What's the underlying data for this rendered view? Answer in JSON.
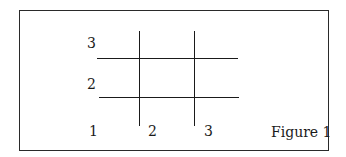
{
  "figure": {
    "caption": "Figure 1",
    "x_labels": [
      "1",
      "2",
      "3"
    ],
    "y_labels": [
      "2",
      "3"
    ],
    "line_color": "#1a1a1a",
    "border_color": "#2a2a2a"
  }
}
